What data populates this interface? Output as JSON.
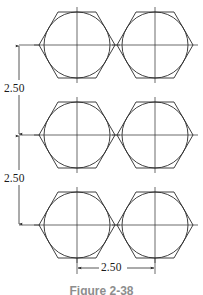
{
  "figure": {
    "caption": "Figure 2-38",
    "type": "engineering-drawing"
  },
  "dimensions": {
    "vertical_top": {
      "value": "2.50",
      "orientation": "vertical",
      "description": "Vertical spacing between row 1 and row 2 centers"
    },
    "vertical_bottom": {
      "value": "2.50",
      "orientation": "vertical",
      "description": "Vertical spacing between row 2 and row 3 centers"
    },
    "horizontal_bottom": {
      "value": "2.50",
      "orientation": "horizontal",
      "description": "Horizontal spacing between left and right column centers"
    }
  },
  "geometry": {
    "columns": 2,
    "rows": 3,
    "column_centers_x": [
      77,
      155
    ],
    "row_centers_y": [
      45,
      135,
      225
    ],
    "hexagon_circumradius": 38,
    "circle_radius": 33,
    "line_color": "#2b2b2b",
    "background_color": "#ffffff"
  },
  "shapes": [
    {
      "name": "hex-circle-r1c1",
      "cx": 77,
      "cy": 45,
      "label": "top-left bolt head"
    },
    {
      "name": "hex-circle-r1c2",
      "cx": 155,
      "cy": 45,
      "label": "top-right bolt head"
    },
    {
      "name": "hex-circle-r2c1",
      "cx": 77,
      "cy": 135,
      "label": "middle-left bolt head"
    },
    {
      "name": "hex-circle-r2c2",
      "cx": 155,
      "cy": 135,
      "label": "middle-right bolt head"
    },
    {
      "name": "hex-circle-r3c1",
      "cx": 77,
      "cy": 225,
      "label": "bottom-left bolt head"
    },
    {
      "name": "hex-circle-r3c2",
      "cx": 155,
      "cy": 225,
      "label": "bottom-right bolt head"
    }
  ]
}
